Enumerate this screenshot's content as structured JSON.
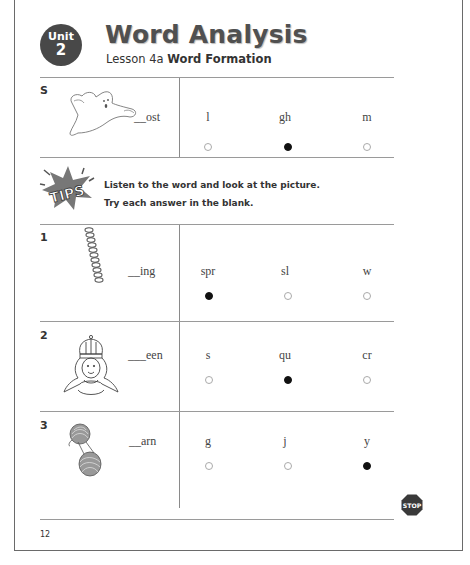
{
  "header": {
    "unit_label": "Unit",
    "unit_number": "2",
    "title": "Word Analysis",
    "lesson_prefix": "Lesson 4a",
    "lesson_name": "Word Formation"
  },
  "sample": {
    "label": "S",
    "picture": "ghost",
    "word": "__ost",
    "choices": [
      "l",
      "gh",
      "m"
    ],
    "selected_index": 1
  },
  "tips": {
    "badge": "TIPS",
    "line1": "Listen to the word and look at the picture.",
    "line2": "Try each answer in the blank."
  },
  "items": [
    {
      "number": "1",
      "picture": "spring",
      "word": "__ing",
      "choices": [
        "spr",
        "sl",
        "w"
      ],
      "selected_index": 0
    },
    {
      "number": "2",
      "picture": "queen",
      "word": "___een",
      "choices": [
        "s",
        "qu",
        "cr"
      ],
      "selected_index": 1
    },
    {
      "number": "3",
      "picture": "yarn",
      "word": "__arn",
      "choices": [
        "g",
        "j",
        "y"
      ],
      "selected_index": 2
    }
  ],
  "stop_label": "STOP",
  "footer": {
    "page_number": "12"
  },
  "colors": {
    "badge": "#484848",
    "title": "#505050",
    "filled_bubble": "#111111",
    "stop": "#3a3a3a"
  }
}
